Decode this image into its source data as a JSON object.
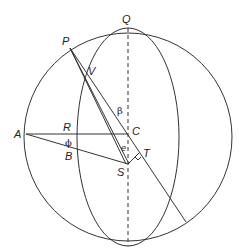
{
  "diagram": {
    "type": "celestial sphere geometry",
    "labels": {
      "Q": "Q",
      "P": "P",
      "V": "V",
      "beta": "β",
      "A": "A",
      "R": "R",
      "C": "C",
      "phi": "ϕ",
      "e": "e",
      "T": "T",
      "B": "B",
      "S": "S"
    },
    "colors": {
      "stroke": "#333333",
      "background": "#ffffff"
    }
  }
}
